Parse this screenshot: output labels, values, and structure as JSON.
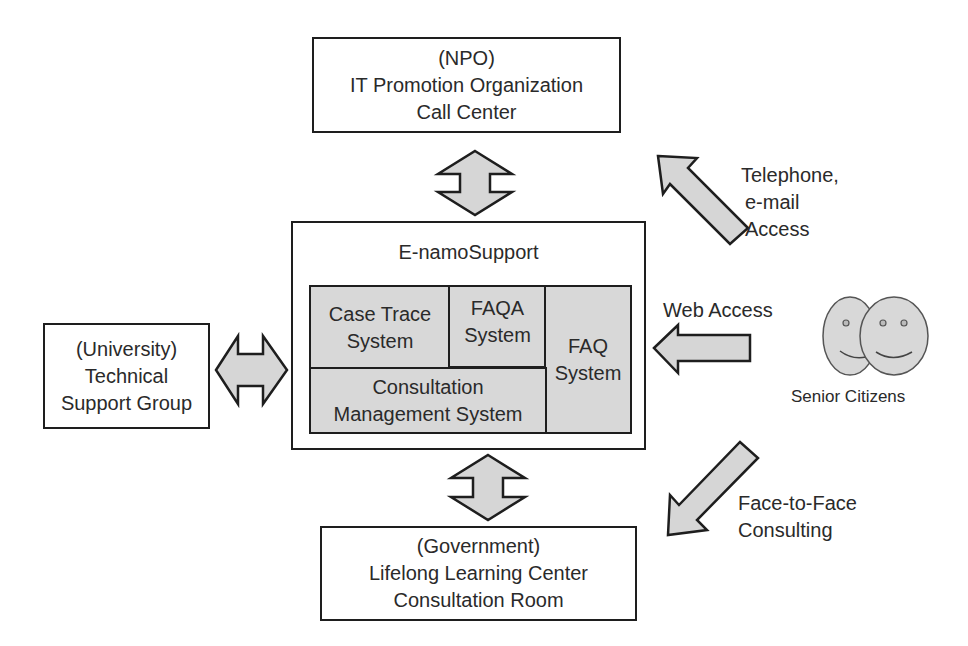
{
  "npo_box": {
    "lines": [
      "(NPO)",
      "IT Promotion Organization",
      "Call Center"
    ]
  },
  "university_box": {
    "lines": [
      "(University)",
      "Technical",
      "Support Group"
    ]
  },
  "government_box": {
    "lines": [
      "(Government)",
      "Lifelong Learning Center",
      "Consultation Room"
    ]
  },
  "core": {
    "title": "E-namoSupport",
    "modules": {
      "case_trace": [
        "Case Trace",
        "System"
      ],
      "faqa": [
        "FAQA",
        "System"
      ],
      "faq": [
        "FAQ",
        "System"
      ],
      "consultation": [
        "Consultation",
        "Management System"
      ]
    }
  },
  "access": {
    "telephone": [
      "Telephone,",
      "e-mail",
      "Access"
    ],
    "web": "Web Access",
    "face_to_face": [
      "Face-to-Face",
      "Consulting"
    ]
  },
  "users": {
    "label": "Senior Citizens"
  },
  "colors": {
    "fill_grey": "#d8d8d8",
    "stroke": "#1e1e1e",
    "text": "#2a2a2a"
  }
}
